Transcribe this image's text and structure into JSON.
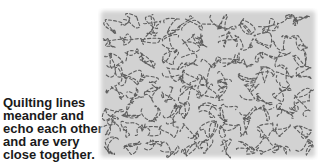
{
  "caption": {
    "lines": [
      "Quilting lines",
      "meander and",
      "echo each other",
      "and are very",
      "close together."
    ]
  },
  "swatch": {
    "description": "Meandering stipple quilting pattern on gray fabric",
    "fabric_color": "#d2d2d2",
    "stitch_color": "#4a4a4a",
    "icon": "stipple-quilt-pattern"
  }
}
